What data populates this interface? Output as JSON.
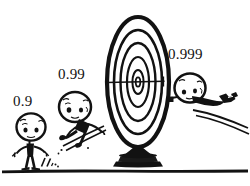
{
  "figure": {
    "type": "cartoon-illustration",
    "background_color": "#ffffff",
    "ink_color": "#121212",
    "width": 250,
    "height": 186
  },
  "labels": [
    {
      "text": "0.9",
      "name": "probability-label-0-9"
    },
    {
      "text": "0.99",
      "name": "probability-label-0-99"
    },
    {
      "text": "0.999",
      "name": "probability-label-0-999"
    }
  ],
  "characters": [
    {
      "name": "walking-figure",
      "label": "0.9",
      "pose": "standing-walking",
      "distance_from_target": "farthest"
    },
    {
      "name": "leaping-figure",
      "label": "0.99",
      "pose": "leaping-forward",
      "distance_from_target": "middle"
    },
    {
      "name": "flying-figure",
      "label": "0.999",
      "pose": "flying-diving-horizontal",
      "distance_from_target": "closest"
    }
  ],
  "target": {
    "name": "bullseye-target",
    "shape": "ellipse",
    "ring_count": 5,
    "center_x": 138,
    "center_y": 82,
    "has_sight_line": true,
    "stand": "pedestal-with-flared-base"
  },
  "ground": {
    "name": "ground-line",
    "y": 170,
    "style": "thick-horizontal-ink-line"
  }
}
